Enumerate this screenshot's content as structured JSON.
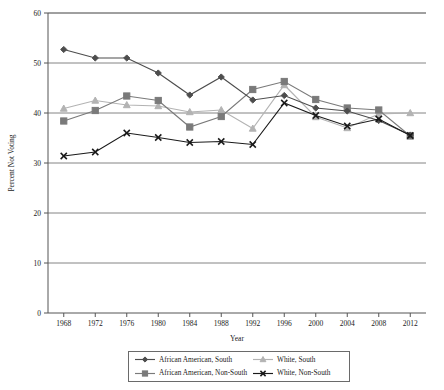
{
  "chart_data": {
    "type": "line",
    "title": "",
    "xlabel": "Year",
    "ylabel": "Percent Not Voting",
    "categories": [
      1968,
      1972,
      1976,
      1980,
      1984,
      1988,
      1992,
      1996,
      2000,
      2004,
      2008,
      2012
    ],
    "x_tick_labels": [
      "1968",
      "1972",
      "1976",
      "1980",
      "1984",
      "1988",
      "1992",
      "1996",
      "2000",
      "2004",
      "2008",
      "2012"
    ],
    "y_tick_labels": [
      "0",
      "10",
      "20",
      "30",
      "40",
      "50",
      "60"
    ],
    "y_ticks": [
      0,
      10,
      20,
      30,
      40,
      50,
      60
    ],
    "ylim": [
      0,
      60
    ],
    "grid": "horizontal",
    "legend_position": "bottom-center",
    "series": [
      {
        "name": "African American, South",
        "color": "#4d4d4d",
        "marker": "diamond",
        "values": [
          52.7,
          51.0,
          51.0,
          48.0,
          43.6,
          47.2,
          42.6,
          43.5,
          41.0,
          40.4,
          38.5,
          35.6
        ]
      },
      {
        "name": "African American, Non-South",
        "color": "#7a7a7a",
        "marker": "square",
        "values": [
          38.4,
          40.5,
          43.4,
          42.5,
          37.2,
          39.3,
          44.7,
          46.3,
          42.7,
          41.0,
          40.6,
          35.4
        ]
      },
      {
        "name": "White, South",
        "color": "#b3b3b3",
        "marker": "triangle",
        "values": [
          40.9,
          42.5,
          41.6,
          41.4,
          40.2,
          40.6,
          36.9,
          45.6,
          39.2,
          37.0,
          39.8,
          40.0
        ]
      },
      {
        "name": "White, Non-South",
        "color": "#1a1a1a",
        "marker": "cross",
        "values": [
          31.4,
          32.2,
          36.0,
          35.1,
          34.1,
          34.3,
          33.7,
          42.0,
          39.5,
          37.4,
          38.8,
          35.5
        ]
      }
    ]
  },
  "legend": {
    "entries": [
      {
        "label": "African American, South"
      },
      {
        "label": "White, South"
      },
      {
        "label": "African American, Non-South"
      },
      {
        "label": "White, Non-South"
      }
    ]
  }
}
